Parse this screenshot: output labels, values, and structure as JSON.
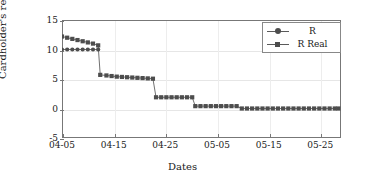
{
  "chart_data": {
    "type": "line",
    "title": "",
    "xlabel": "Dates",
    "ylabel": "Cardholder's reputation",
    "grid": true,
    "legend_position": "top-right",
    "xlim": [
      0,
      54
    ],
    "ylim": [
      -5,
      15
    ],
    "y_ticks": [
      -5,
      0,
      5,
      10,
      15
    ],
    "y_ticklabels": [
      "-5",
      "0",
      "5",
      "10",
      "15"
    ],
    "x_ticks": [
      0,
      10,
      20,
      30,
      40,
      50
    ],
    "x_ticklabels": [
      "04-05",
      "04-15",
      "04-25",
      "05-05",
      "05-15",
      "05-25"
    ],
    "series": [
      {
        "name": "R",
        "marker": "circle",
        "color": "#4d4d4d",
        "x": [
          0,
          1,
          2,
          3,
          4,
          5,
          6,
          7
        ],
        "values": [
          10,
          10,
          10,
          10,
          10,
          10,
          10,
          10
        ]
      },
      {
        "name": "R Real",
        "marker": "square",
        "color": "#4d4d4d",
        "x": [
          0,
          1,
          2,
          3,
          4,
          5,
          6,
          7,
          7.4,
          8.6,
          9.6,
          10.6,
          11.6,
          12.6,
          13.6,
          14.6,
          15.6,
          16.6,
          17.6,
          18.2,
          19.2,
          20.2,
          21.2,
          22.2,
          23.2,
          24.2,
          25.2,
          25.8,
          26.8,
          27.8,
          28.8,
          29.8,
          30.8,
          31.8,
          32.8,
          33.8,
          34.8,
          35.8,
          36.8,
          37.8,
          38.8,
          39.8,
          40.8,
          41.8,
          42.8,
          43.8,
          44.8,
          45.8,
          46.8,
          47.8,
          48.8,
          49.8,
          50.8,
          51.8,
          52.8,
          53.5
        ],
        "values": [
          12.2,
          12.0,
          11.8,
          11.6,
          11.4,
          11.2,
          11.0,
          10.7,
          5.7,
          5.6,
          5.5,
          5.4,
          5.35,
          5.3,
          5.25,
          5.2,
          5.15,
          5.1,
          5.05,
          1.9,
          1.9,
          1.9,
          1.9,
          1.9,
          1.9,
          1.9,
          1.9,
          0.4,
          0.4,
          0.4,
          0.4,
          0.4,
          0.4,
          0.4,
          0.4,
          0.4,
          0.0,
          0.0,
          0.0,
          0.0,
          0.0,
          0.0,
          0.0,
          0.0,
          0.0,
          0.0,
          0.0,
          0.0,
          0.0,
          0.0,
          0.0,
          0.0,
          0.0,
          0.0,
          0.0,
          0.0
        ]
      }
    ]
  },
  "axes": {
    "y_title": "Cardholder's reputation",
    "x_title": "Dates"
  },
  "legend": {
    "entries": [
      {
        "label": "R",
        "marker": "circle"
      },
      {
        "label": "R Real",
        "marker": "square"
      }
    ]
  },
  "colors": {
    "series": "#4d4d4d",
    "frame": "#777777",
    "grid": "#e6e6e6",
    "text": "#1a1a1a"
  }
}
